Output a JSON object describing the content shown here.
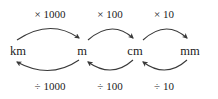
{
  "diagram": {
    "type": "metric-unit-conversion-chart",
    "stroke_color": "#3a3a3a",
    "text_color": "#1c1c1c",
    "background_color": "#ffffff",
    "units": [
      {
        "label": "km",
        "x": 18
      },
      {
        "label": "m",
        "x": 82
      },
      {
        "label": "cm",
        "x": 135
      },
      {
        "label": "mm",
        "x": 190
      }
    ],
    "multiply_steps": [
      {
        "label": "× 1000",
        "x": 50,
        "from": "km",
        "to": "m"
      },
      {
        "label": "× 100",
        "x": 110,
        "from": "m",
        "to": "cm"
      },
      {
        "label": "× 10",
        "x": 164,
        "from": "cm",
        "to": "mm"
      }
    ],
    "divide_steps": [
      {
        "label": "÷ 1000",
        "x": 50,
        "from": "m",
        "to": "km"
      },
      {
        "label": "÷ 100",
        "x": 110,
        "from": "cm",
        "to": "m"
      },
      {
        "label": "÷ 10",
        "x": 164,
        "from": "mm",
        "to": "cm"
      }
    ]
  }
}
